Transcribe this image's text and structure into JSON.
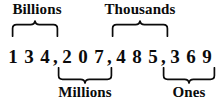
{
  "figure": {
    "kind": "place-value-chart",
    "number": "134,207,485,369",
    "background_color": "#ffffff",
    "text_color": "#0b0b0b"
  },
  "labels": {
    "top": [
      {
        "id": "billions",
        "text": "Billions"
      },
      {
        "id": "thousands",
        "text": "Thousands"
      }
    ],
    "bottom": [
      {
        "id": "millions",
        "text": "Millions"
      },
      {
        "id": "ones",
        "text": "Ones"
      }
    ]
  },
  "braces": [
    {
      "id": "billions-brace",
      "direction": "up",
      "spans": "billions-period"
    },
    {
      "id": "thousands-brace",
      "direction": "up",
      "spans": "thousands-period"
    },
    {
      "id": "millions-brace",
      "direction": "down",
      "spans": "millions-period"
    },
    {
      "id": "ones-brace",
      "direction": "down",
      "spans": "ones-period"
    }
  ],
  "periods": [
    {
      "id": "billions-period",
      "name": "Billions",
      "digits": [
        "1",
        "3",
        "4"
      ],
      "separator": ","
    },
    {
      "id": "millions-period",
      "name": "Millions",
      "digits": [
        "2",
        "0",
        "7"
      ],
      "separator": ","
    },
    {
      "id": "thousands-period",
      "name": "Thousands",
      "digits": [
        "4",
        "8",
        "5"
      ],
      "separator": ","
    },
    {
      "id": "ones-period",
      "name": "Ones",
      "digits": [
        "3",
        "6",
        "9"
      ],
      "separator": ""
    }
  ]
}
